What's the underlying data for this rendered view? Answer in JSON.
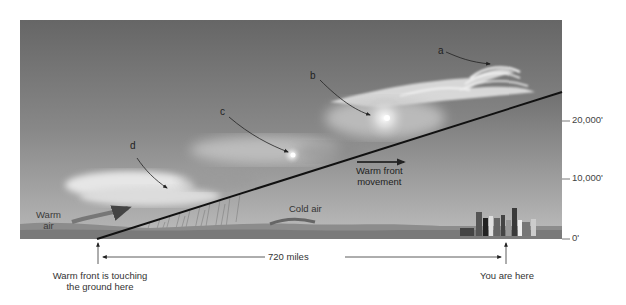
{
  "diagram": {
    "cloud_labels": [
      {
        "id": "a",
        "label": "a"
      },
      {
        "id": "b",
        "label": "b"
      },
      {
        "id": "c",
        "label": "c"
      },
      {
        "id": "d",
        "label": "d"
      }
    ],
    "air_labels": {
      "warm_air": "Warm air",
      "warm_air_line1": "Warm",
      "warm_air_line2": "air",
      "cold_air": "Cold air"
    },
    "movement": {
      "line1": "Warm front",
      "line2": "movement"
    },
    "altitude_axis": [
      {
        "label": "20,000'",
        "value": 20000
      },
      {
        "label": "10,000'",
        "value": 10000
      },
      {
        "label": "0'",
        "value": 0
      }
    ],
    "distance": {
      "label": "720 miles"
    },
    "markers": {
      "front_ground_line1": "Warm front is touching",
      "front_ground_line2": "the ground here",
      "you_are_here": "You are here"
    },
    "colors": {
      "sky_top": "#6e6e6e",
      "sky_bottom": "#b4b4b4",
      "front_line": "#111111",
      "cloud": "#f4f4f4",
      "ground": "#8a8a8a"
    }
  }
}
